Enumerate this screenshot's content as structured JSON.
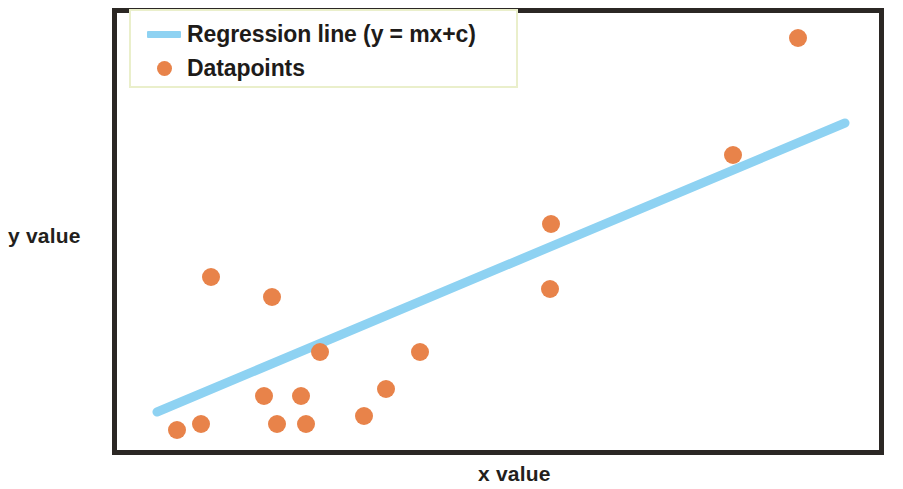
{
  "figure": {
    "background_color": "#ffffff",
    "frame_color": "#2b2724"
  },
  "legend": {
    "position": "upper-left",
    "border_color": "#eaefcb",
    "items": [
      {
        "label": "Regression line (y = mx+c)",
        "marker": "line",
        "color": "#8ed2f2"
      },
      {
        "label": "Datapoints",
        "marker": "circle",
        "color": "#e8834a"
      }
    ]
  },
  "axes": {
    "x_label": "x value",
    "y_label": "y value"
  },
  "chart_data": {
    "type": "scatter",
    "title": "",
    "xlabel": "x value",
    "ylabel": "y value",
    "xlim": [
      0,
      100
    ],
    "ylim": [
      0,
      100
    ],
    "grid": false,
    "legend_position": "upper left",
    "series": [
      {
        "name": "Datapoints",
        "type": "scatter",
        "color": "#e8834a",
        "marker_radius_px": 9,
        "points": [
          {
            "x": 8.6,
            "y": 6.0,
            "px": 177,
            "py": 430
          },
          {
            "x": 11.7,
            "y": 7.4,
            "px": 201,
            "py": 424
          },
          {
            "x": 12.9,
            "y": 40.3,
            "px": 211,
            "py": 277
          },
          {
            "x": 20.8,
            "y": 13.8,
            "px": 264,
            "py": 396
          },
          {
            "x": 21.4,
            "y": 35.8,
            "px": 272,
            "py": 297
          },
          {
            "x": 22.5,
            "y": 7.4,
            "px": 277,
            "py": 424
          },
          {
            "x": 25.9,
            "y": 13.8,
            "px": 301,
            "py": 396
          },
          {
            "x": 26.2,
            "y": 7.4,
            "px": 306,
            "py": 424
          },
          {
            "x": 28.2,
            "y": 25.1,
            "px": 320,
            "py": 352
          },
          {
            "x": 33.8,
            "y": 9.2,
            "px": 364,
            "py": 416
          },
          {
            "x": 37.0,
            "y": 17.5,
            "px": 386,
            "py": 389
          },
          {
            "x": 41.8,
            "y": 25.1,
            "px": 420,
            "py": 352
          },
          {
            "x": 58.5,
            "y": 53.7,
            "px": 551,
            "py": 224
          },
          {
            "x": 58.3,
            "y": 38.1,
            "px": 550,
            "py": 289
          },
          {
            "x": 82.0,
            "y": 68.1,
            "px": 733,
            "py": 155
          },
          {
            "x": 90.4,
            "y": 94.2,
            "px": 798,
            "py": 38
          }
        ]
      },
      {
        "name": "Regression line (y = mx+c)",
        "type": "line",
        "color": "#8ed2f2",
        "line_width_px": 9,
        "endpoints": [
          {
            "x": 5.7,
            "y": 10.3,
            "px": 157,
            "py": 412
          },
          {
            "x": 94.4,
            "y": 75.4,
            "px": 845,
            "py": 123
          }
        ]
      }
    ]
  }
}
